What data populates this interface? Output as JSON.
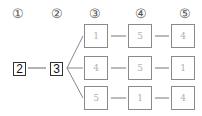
{
  "diagram": {
    "type": "tree",
    "column_labels": [
      "①",
      "②",
      "③",
      "④",
      "⑤"
    ],
    "root": "2",
    "second": "3",
    "branches": [
      [
        "1",
        "5",
        "4"
      ],
      [
        "4",
        "5",
        "1"
      ],
      [
        "5",
        "1",
        "4"
      ]
    ]
  }
}
